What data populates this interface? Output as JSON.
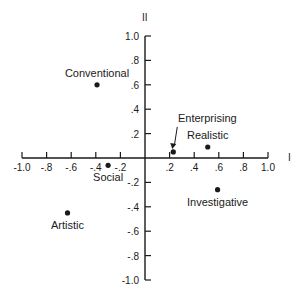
{
  "chart_data": {
    "type": "scatter",
    "title": "",
    "xlabel": "I",
    "ylabel": "II",
    "xlim": [
      -1.0,
      1.0
    ],
    "ylim": [
      -1.0,
      1.0
    ],
    "grid": false,
    "x_ticks": [
      -1.0,
      -0.8,
      -0.6,
      -0.4,
      -0.2,
      0.2,
      0.4,
      0.6,
      0.8,
      1.0
    ],
    "x_tick_labels": [
      "-1.0",
      "-.8",
      "-.6",
      "-.4",
      "-.2",
      ".2",
      ".4",
      ".6",
      ".8",
      "1.0"
    ],
    "y_ticks": [
      1.0,
      0.8,
      0.6,
      0.4,
      0.2,
      -0.2,
      -0.4,
      -0.6,
      -0.8,
      -1.0
    ],
    "y_tick_labels": [
      "1.0",
      ".8",
      ".6",
      ".4",
      ".2",
      "-.2",
      "-.4",
      "-.6",
      "-.8",
      "-1.0"
    ],
    "points": [
      {
        "label": "Conventional",
        "x": -0.39,
        "y": 0.6,
        "label_pos": "above"
      },
      {
        "label": "Social",
        "x": -0.3,
        "y": -0.06,
        "label_pos": "below"
      },
      {
        "label": "Enterprising",
        "x": 0.23,
        "y": 0.05,
        "label_pos": "above-arrow"
      },
      {
        "label": "Realistic",
        "x": 0.51,
        "y": 0.09,
        "label_pos": "above"
      },
      {
        "label": "Investigative",
        "x": 0.59,
        "y": -0.26,
        "label_pos": "below"
      },
      {
        "label": "Artistic",
        "x": -0.63,
        "y": -0.45,
        "label_pos": "below"
      }
    ]
  }
}
